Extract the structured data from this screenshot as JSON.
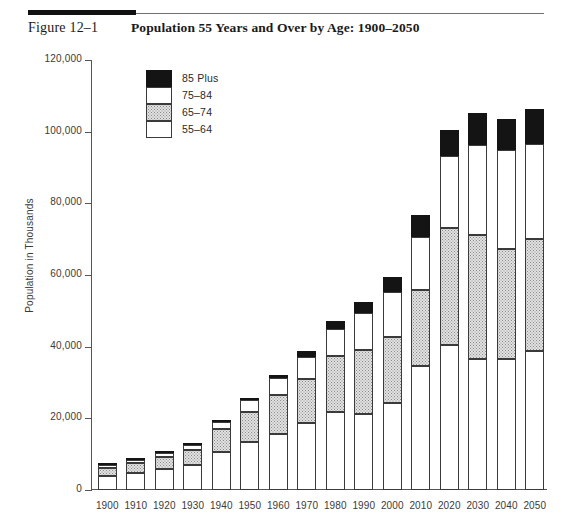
{
  "figure": {
    "label": "Figure 12–1",
    "title": "Population 55 Years and Over by Age: 1900–2050"
  },
  "chart_data": {
    "type": "bar",
    "stacked": true,
    "title": "Population 55 Years and Over by Age: 1900–2050",
    "xlabel": "",
    "ylabel": "Population in Thousands",
    "ylim": [
      0,
      120000
    ],
    "yticks": [
      0,
      20000,
      40000,
      60000,
      80000,
      100000,
      120000
    ],
    "ytick_labels": [
      "0",
      "20,000",
      "40,000",
      "60,000",
      "80,000",
      "100,000",
      "120,000"
    ],
    "grid": false,
    "legend_position": "upper-left-inside",
    "categories": [
      "1900",
      "1910",
      "1920",
      "1930",
      "1940",
      "1950",
      "1960",
      "1970",
      "1980",
      "1990",
      "2000",
      "2010",
      "2020",
      "2030",
      "2040",
      "2050"
    ],
    "series": [
      {
        "name": "55–64",
        "swatch": "white",
        "values": [
          4000,
          4800,
          6000,
          7100,
          10500,
          13400,
          15600,
          18600,
          21700,
          21100,
          24400,
          34500,
          40500,
          36600,
          36700,
          38700
        ]
      },
      {
        "name": "65–74",
        "swatch": "gray",
        "values": [
          2200,
          2700,
          3200,
          4000,
          6400,
          8400,
          11000,
          12500,
          15600,
          18100,
          18400,
          21400,
          32700,
          34700,
          30500,
          31400
        ]
      },
      {
        "name": "75–84",
        "swatch": "white",
        "values": [
          800,
          1000,
          1200,
          1500,
          2100,
          3300,
          4600,
          6100,
          7700,
          10100,
          12400,
          14700,
          20000,
          25000,
          27700,
          26500
        ]
      },
      {
        "name": "85 Plus",
        "swatch": "black",
        "values": [
          120,
          170,
          200,
          300,
          400,
          600,
          900,
          1500,
          2200,
          3100,
          4300,
          6100,
          7300,
          8800,
          8700,
          9600
        ]
      }
    ],
    "totals": [
      7120,
      8670,
      10600,
      12900,
      19400,
      25700,
      32100,
      38700,
      47200,
      52400,
      59500,
      76700,
      100500,
      105100,
      103600,
      106200
    ]
  },
  "legend": {
    "entries": [
      {
        "label": "85 Plus",
        "swatch": "black"
      },
      {
        "label": "75–84",
        "swatch": "white"
      },
      {
        "label": "65–74",
        "swatch": "gray"
      },
      {
        "label": "55–64",
        "swatch": "white"
      }
    ]
  }
}
